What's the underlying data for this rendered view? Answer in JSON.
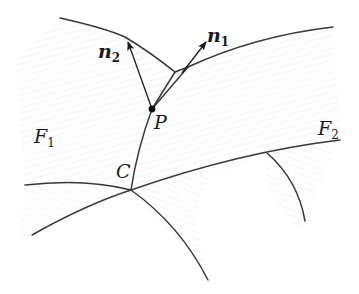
{
  "figure": {
    "type": "geometric-diagram",
    "colors": {
      "line": "#3a3a3a",
      "hatch": "#c8c8c8",
      "background": "#ffffff"
    },
    "labels": {
      "n1": {
        "base": "n",
        "sub": "1"
      },
      "n2": {
        "base": "n",
        "sub": "2"
      },
      "P": "P",
      "C": "C",
      "F1": {
        "base": "F",
        "sub": "1"
      },
      "F2": {
        "base": "F",
        "sub": "2"
      }
    },
    "points": {
      "P": [
        152,
        109
      ],
      "C": [
        131,
        190
      ]
    }
  }
}
